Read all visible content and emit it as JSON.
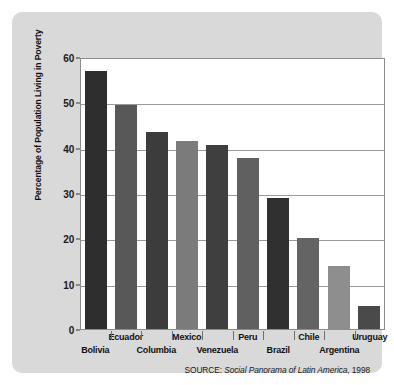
{
  "chart_data": {
    "type": "bar",
    "title": "",
    "xlabel": "",
    "ylabel": "Percentage of Population Living in Poverty",
    "ylim": [
      0,
      60
    ],
    "yticks": [
      0,
      10,
      20,
      30,
      40,
      50,
      60
    ],
    "ytick_labels": [
      "0",
      "10",
      "20",
      "30",
      "40",
      "50",
      "60"
    ],
    "grid": true,
    "legend": "none",
    "categories": [
      "Bolivia",
      "Ecuador",
      "Columbia",
      "Mexico",
      "Venezuela",
      "Peru",
      "Brazil",
      "Chile",
      "Argentina",
      "Uruguay"
    ],
    "values": [
      57,
      49.5,
      43.5,
      41.5,
      40.5,
      37.8,
      28.8,
      20,
      14,
      5
    ],
    "bar_colors": [
      "#2e2e2e",
      "#585858",
      "#3c3c3c",
      "#7b7b7b",
      "#3f3f3f",
      "#606060",
      "#303030",
      "#646464",
      "#8e8e8e",
      "#4a4a4a"
    ],
    "label_rows": [
      "bottom",
      "top",
      "bottom",
      "top",
      "bottom",
      "top",
      "bottom",
      "top",
      "bottom",
      "top"
    ],
    "annotations": [
      "SOURCE: Social Panorama of Latin America, 1998"
    ]
  },
  "source_note": {
    "prefix": "SOURCE:",
    "title": "Social Panorama of Latin America",
    "year": ", 1998"
  },
  "colors": {
    "panel_background": "#d9d9d9",
    "plot_background": "#ffffff",
    "gridline": "#9a9a9a",
    "axis": "#8c8c8c",
    "text": "#111111"
  }
}
